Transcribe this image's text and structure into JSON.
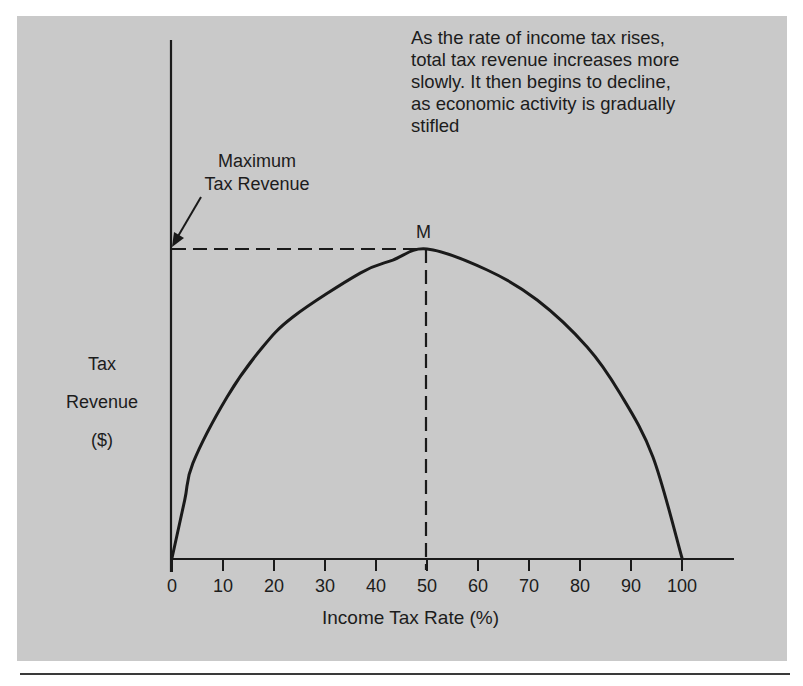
{
  "chart_data": {
    "type": "line",
    "title": "",
    "xlabel": "Income Tax Rate (%)",
    "ylabel": "Tax Revenue ($)",
    "ylabel_lines": [
      "Tax",
      "Revenue",
      "($)"
    ],
    "xlim": [
      0,
      100
    ],
    "ylim": [
      0,
      100
    ],
    "x_ticks": [
      0,
      10,
      20,
      30,
      40,
      50,
      60,
      70,
      80,
      90,
      100
    ],
    "y_ticks": [],
    "grid": false,
    "legend": null,
    "series": [
      {
        "name": "Tax Revenue (Laffer curve)",
        "x": [
          0,
          2.5,
          4.1,
          10.8,
          17.3,
          23.7,
          36.9,
          43.3,
          50,
          61.8,
          71.6,
          81.4,
          87.8,
          94.3,
          100
        ],
        "y": [
          0,
          18.8,
          30.7,
          52.1,
          67.3,
          78.0,
          92.2,
          96.4,
          100,
          93.2,
          83.5,
          68.3,
          53.4,
          32.7,
          0
        ]
      }
    ],
    "peak": {
      "label": "M",
      "x": 50,
      "y": 100
    },
    "annotations": [
      {
        "text": "As the rate of income tax rises, total tax revenue increases more slowly. It then begins to decline, as economic activity is gradually stifled",
        "lines": [
          "As the rate of income tax rises,",
          "total tax revenue increases more",
          "slowly. It then begins to decline,",
          "as economic activity is gradually",
          "stifled"
        ]
      },
      {
        "text": "Maximum Tax Revenue",
        "lines": [
          "Maximum",
          "Tax Revenue"
        ],
        "arrow_to": "y-axis at peak revenue"
      }
    ],
    "reference_lines": [
      {
        "type": "horizontal-dashed",
        "at_y": 100,
        "from_x": 0,
        "to_x": 50
      },
      {
        "type": "vertical-dashed",
        "at_x": 50,
        "from_y": 0,
        "to_y": 100
      }
    ]
  },
  "colors": {
    "panel_background": "#c9c9c9",
    "ink": "#1a1a1a",
    "page_background": "#ffffff"
  }
}
